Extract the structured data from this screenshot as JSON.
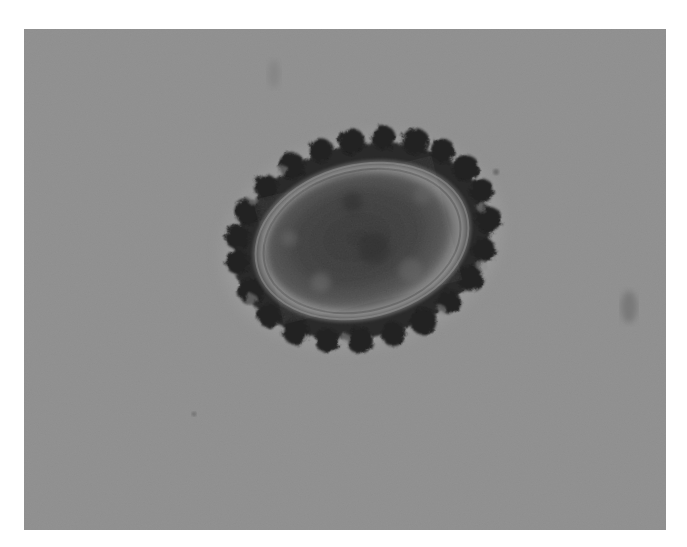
{
  "image": {
    "kind": "brightfield micrograph",
    "subject": "single oval egg with mammillated (bumpy) outer coat on gray background",
    "colors": {
      "background": "#8e8e8e",
      "page": "#ffffff",
      "shell_dark": "#1c1c1c",
      "inner_mass": "#3a3a3a",
      "inner_ring_light": "#9a9a9a"
    }
  }
}
